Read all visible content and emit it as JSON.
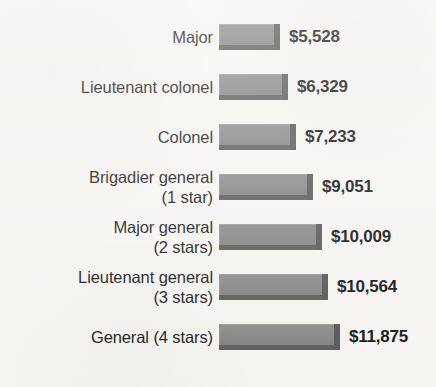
{
  "chart_data": {
    "type": "bar",
    "orientation": "horizontal",
    "title": "",
    "subtitle": "",
    "xlabel": "",
    "ylabel": "",
    "grid": false,
    "legend": null,
    "axis_visible": false,
    "value_prefix": "$",
    "categories": [
      "Major",
      "Lieutenant colonel",
      "Colonel",
      "Brigadier general (1 star)",
      "Major general (2 stars)",
      "Lieutenant general (3 stars)",
      "General (4 stars)"
    ],
    "values": [
      5528,
      6329,
      7233,
      9051,
      10009,
      10564,
      11875
    ],
    "value_labels": [
      "$5,528",
      "$6,329",
      "$7,233",
      "$9,051",
      "$10,009",
      "$10,564",
      "$11,875"
    ],
    "xlim": [
      0,
      11875
    ],
    "bar_color": "#888888",
    "bar_shadow_color": "#585858",
    "background_color": "#f7f6f3",
    "text_color": "#1c1c1c"
  },
  "rows": [
    {
      "label_line1": "Major",
      "label_line2": "",
      "two_line": false,
      "value": "$5,528",
      "amount": 5528,
      "bar_px": 61
    },
    {
      "label_line1": "Lieutenant colonel",
      "label_line2": "",
      "two_line": false,
      "value": "$6,329",
      "amount": 6329,
      "bar_px": 69
    },
    {
      "label_line1": "Colonel",
      "label_line2": "",
      "two_line": false,
      "value": "$7,233",
      "amount": 7233,
      "bar_px": 77
    },
    {
      "label_line1": "Brigadier general",
      "label_line2": "(1 star)",
      "two_line": true,
      "value": "$9,051",
      "amount": 9051,
      "bar_px": 94
    },
    {
      "label_line1": "Major general",
      "label_line2": "(2 stars)",
      "two_line": true,
      "value": "$10,009",
      "amount": 10009,
      "bar_px": 103
    },
    {
      "label_line1": "Lieutenant general",
      "label_line2": "(3 stars)",
      "two_line": true,
      "value": "$10,564",
      "amount": 10564,
      "bar_px": 109
    },
    {
      "label_line1": "General (4 stars)",
      "label_line2": "",
      "two_line": false,
      "value": "$11,875",
      "amount": 11875,
      "bar_px": 121
    }
  ],
  "layout": {
    "bar_left_px": 219,
    "row_height_px": 50,
    "first_row_top_px": 12,
    "value_gap_px": 9
  }
}
